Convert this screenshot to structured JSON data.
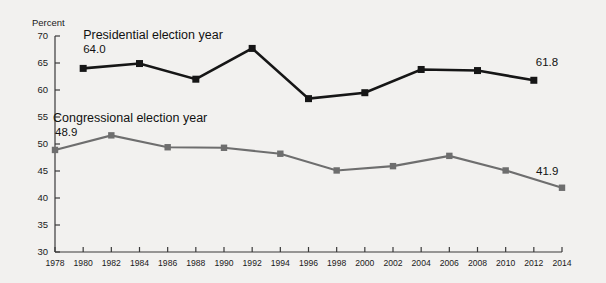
{
  "chart_data": {
    "type": "line",
    "title": "",
    "xlabel": "",
    "ylabel": "Percent",
    "ylim": [
      30,
      70
    ],
    "ytick_step": 5,
    "yticks": [
      30,
      35,
      40,
      45,
      50,
      55,
      60,
      65,
      70
    ],
    "grid": false,
    "legend": "inline-annotations",
    "categories": [
      1978,
      1980,
      1982,
      1984,
      1986,
      1988,
      1990,
      1992,
      1994,
      1996,
      1998,
      2000,
      2002,
      2004,
      2006,
      2008,
      2010,
      2012,
      2014
    ],
    "xtick_labels": [
      "1978",
      "1980",
      "1982",
      "1984",
      "1986",
      "1988",
      "1990",
      "1992",
      "1994",
      "1996",
      "1998",
      "2000",
      "2002",
      "2004",
      "2006",
      "2008",
      "2010",
      "2012",
      "2014"
    ],
    "series": [
      {
        "name": "Presidential election year",
        "color": "#161616",
        "marker": "square",
        "x": [
          1980,
          1984,
          1988,
          1992,
          1996,
          2000,
          2004,
          2008,
          2012
        ],
        "values": [
          64.0,
          64.9,
          62.0,
          67.7,
          58.4,
          59.5,
          63.8,
          63.6,
          61.8
        ]
      },
      {
        "name": "Congressional election year",
        "color": "#6e6e6e",
        "marker": "square",
        "x": [
          1978,
          1982,
          1986,
          1990,
          1994,
          1998,
          2002,
          2006,
          2010,
          2014
        ],
        "values": [
          48.9,
          51.6,
          49.4,
          49.3,
          48.2,
          45.1,
          45.9,
          47.8,
          45.1,
          41.9
        ]
      }
    ],
    "annotations": [
      {
        "name": "presidential-series-label",
        "text": "Presidential election year",
        "x": 1980,
        "y": 69.4
      },
      {
        "name": "presidential-start-value",
        "text": "64.0",
        "x": 1980,
        "y": 66.9
      },
      {
        "name": "presidential-end-value",
        "text": "61.8",
        "x": 2012,
        "y": 64.4
      },
      {
        "name": "congressional-series-label",
        "text": "Congressional election year",
        "x": 1978,
        "y": 54.0
      },
      {
        "name": "congressional-start-value",
        "text": "48.9",
        "x": 1978,
        "y": 51.5
      },
      {
        "name": "congressional-end-value",
        "text": "41.9",
        "x": 2014,
        "y": 44.3
      }
    ]
  }
}
